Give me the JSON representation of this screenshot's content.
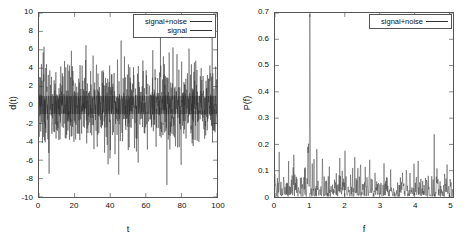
{
  "figure": {
    "background": "#ffffff",
    "trace_color": "#333333",
    "frame_color": "#555555"
  },
  "panels": [
    {
      "id": "left",
      "legend": {
        "position": "top-right",
        "entries": [
          {
            "label": "signal+noise",
            "color": "#333333"
          },
          {
            "label": "signal",
            "color": "#333333"
          }
        ]
      },
      "axes": {
        "xlabel": "t",
        "ylabel": "d(t)",
        "xticks": [
          "0",
          "20",
          "40",
          "60",
          "80",
          "100"
        ],
        "yticks": [
          "10",
          "8",
          "6",
          "4",
          "2",
          "0",
          "-2",
          "-4",
          "-6",
          "-8",
          "-10"
        ]
      }
    },
    {
      "id": "right",
      "legend": {
        "position": "top-right",
        "entries": [
          {
            "label": "signal+noise",
            "color": "#333333"
          }
        ]
      },
      "axes": {
        "xlabel": "f",
        "ylabel": "P(f)",
        "xticks": [
          "0",
          "1",
          "2",
          "3",
          "4",
          "5"
        ],
        "yticks": [
          "0.7",
          "0.6",
          "0.5",
          "0.4",
          "0.3",
          "0.2",
          "0.1",
          "0"
        ]
      }
    }
  ],
  "chart_data": [
    {
      "type": "line",
      "id": "time-series",
      "title": "",
      "xlabel": "t",
      "ylabel": "d(t)",
      "xlim": [
        0,
        100
      ],
      "ylim": [
        -10,
        10
      ],
      "xticks": [
        0,
        20,
        40,
        60,
        80,
        100
      ],
      "yticks": [
        -10,
        -8,
        -6,
        -4,
        -2,
        0,
        2,
        4,
        6,
        8,
        10
      ],
      "grid": false,
      "legend": [
        "signal+noise",
        "signal"
      ],
      "legend_position": "upper right",
      "series": [
        {
          "name": "signal+noise",
          "description": "Sinusoid of unit frequency plus large Gaussian noise; dense oscillation filling the full vertical range, extreme excursions between about -9 and +9, bulk of the samples within +/-4.",
          "model": "sin(2*pi*1.0*t) + gaussian_noise(sigma~2.2)",
          "n_points": 1024,
          "amplitude_typical": 4.0,
          "amplitude_max": 9.0,
          "amplitude_min": -9.2
        },
        {
          "name": "signal",
          "description": "Pure sinusoid of unit amplitude and frequency 1, buried inside the noise trace and not separately distinguishable at this scale.",
          "model": "sin(2*pi*1.0*t)",
          "n_points": 1024,
          "amplitude": 1.0,
          "frequency": 1.0
        }
      ]
    },
    {
      "type": "line",
      "id": "power-spectrum",
      "title": "",
      "xlabel": "f",
      "ylabel": "P(f)",
      "xlim": [
        0,
        5.1
      ],
      "ylim": [
        0,
        0.7
      ],
      "xticks": [
        0,
        1,
        2,
        3,
        4,
        5
      ],
      "yticks": [
        0,
        0.1,
        0.2,
        0.3,
        0.4,
        0.5,
        0.6,
        0.7
      ],
      "grid": false,
      "legend": [
        "signal+noise"
      ],
      "legend_position": "upper right",
      "series": [
        {
          "name": "signal+noise",
          "description": "Periodogram of the noisy time series: a single sharp spectral line at f = 1 rising to about 0.66 above a broadband noise floor of roughly 0.02 to 0.10 with occasional spikes up to about 0.20.",
          "peak": {
            "f": 1.0,
            "P": 0.66
          },
          "secondary_peaks": [
            {
              "f": 0.3,
              "P": 0.2
            },
            {
              "f": 0.95,
              "P": 0.25
            },
            {
              "f": 2.15,
              "P": 0.19
            },
            {
              "f": 4.9,
              "P": 0.17
            }
          ],
          "noise_floor_range": [
            0.01,
            0.1
          ],
          "n_points": 512
        }
      ]
    }
  ]
}
